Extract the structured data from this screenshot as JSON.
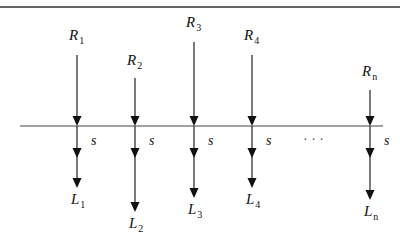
{
  "diagram": {
    "type": "flow-split",
    "line_color": "#333333",
    "columns": [
      {
        "id": "1",
        "top_label": "R",
        "top_sub": "1",
        "bottom_label": "L",
        "bottom_sub": "1",
        "side_label": "s",
        "x": 77,
        "label_y": 40,
        "arrow_top": 55,
        "bottom_tip": 188
      },
      {
        "id": "2",
        "top_label": "R",
        "top_sub": "2",
        "bottom_label": "L",
        "bottom_sub": "2",
        "side_label": "s",
        "x": 135,
        "label_y": 65,
        "arrow_top": 78,
        "bottom_tip": 212
      },
      {
        "id": "3",
        "top_label": "R",
        "top_sub": "3",
        "bottom_label": "L",
        "bottom_sub": "3",
        "side_label": "s",
        "x": 194,
        "label_y": 27,
        "arrow_top": 42,
        "bottom_tip": 198
      },
      {
        "id": "4",
        "top_label": "R",
        "top_sub": "4",
        "bottom_label": "L",
        "bottom_sub": "4",
        "side_label": "s",
        "x": 252,
        "label_y": 40,
        "arrow_top": 55,
        "bottom_tip": 188
      },
      {
        "id": "n",
        "top_label": "R",
        "top_sub": "n",
        "bottom_label": "L",
        "bottom_sub": "n",
        "side_label": "s",
        "x": 370,
        "label_y": 76,
        "arrow_top": 90,
        "bottom_tip": 200
      }
    ],
    "ellipsis": "· · ·",
    "horizontal_line": {
      "x1": 20,
      "x2": 383,
      "y": 126
    },
    "top_border_y": 7
  }
}
